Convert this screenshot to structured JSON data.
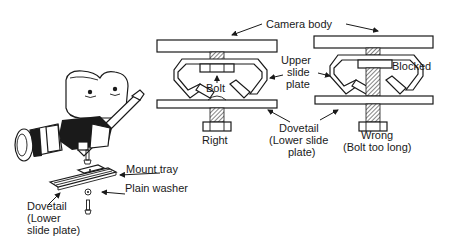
{
  "labels": {
    "camera_body": "Camera body",
    "upper_slide_plate": [
      "Upper",
      "slide",
      "plate"
    ],
    "bolt": "Bolt",
    "blocked": "Blocked",
    "right": "Right",
    "dovetail_center": [
      "Dovetail",
      "(Lower slide",
      "plate)"
    ],
    "wrong": [
      "Wrong",
      "(Bolt too long)"
    ],
    "mount_tray": "Mount tray",
    "plain_washer": "Plain washer",
    "dovetail_left": [
      "Dovetail",
      "(Lower",
      "slide plate)"
    ]
  },
  "colors": {
    "ink": "#1a1a1a",
    "paper": "#ffffff"
  }
}
